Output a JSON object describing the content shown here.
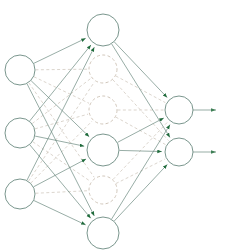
{
  "figure": {
    "type": "neural-network-diagram",
    "title": "",
    "width": 225,
    "height": 251,
    "background": "#ffffff"
  },
  "style": {
    "edge_active_color": "#6b8a80",
    "edge_dropped_color": "#c9bfb3",
    "arrow_color": "#1f6b3b",
    "node_active_stroke": "#6b8a80",
    "node_dropped_stroke": "#cbbfb2",
    "node_fill": "#ffffff",
    "node_radius": 15,
    "edge_width": 0.7,
    "node_stroke_width": 0.9,
    "dropped_dash": "3,2.4"
  },
  "layers": [
    {
      "id": "input",
      "name": "input-layer",
      "x": 20,
      "nodes": [
        {
          "id": "i1",
          "name": "input-node-1",
          "cx": 20,
          "cy": 70,
          "r": 15,
          "state": "active"
        },
        {
          "id": "i2",
          "name": "input-node-2",
          "cx": 20,
          "cy": 133,
          "r": 15,
          "state": "active"
        },
        {
          "id": "i3",
          "name": "input-node-3",
          "cx": 20,
          "cy": 194,
          "r": 15,
          "state": "active"
        }
      ]
    },
    {
      "id": "hidden",
      "name": "hidden-layer",
      "x": 103,
      "nodes": [
        {
          "id": "h1",
          "name": "hidden-node-1",
          "cx": 103,
          "cy": 30,
          "r": 16,
          "state": "active"
        },
        {
          "id": "h2",
          "name": "hidden-node-2",
          "cx": 103,
          "cy": 69,
          "r": 14,
          "state": "dropped"
        },
        {
          "id": "h3",
          "name": "hidden-node-3",
          "cx": 103,
          "cy": 110,
          "r": 14,
          "state": "dropped"
        },
        {
          "id": "h4",
          "name": "hidden-node-4",
          "cx": 103,
          "cy": 150,
          "r": 16,
          "state": "active"
        },
        {
          "id": "h5",
          "name": "hidden-node-5",
          "cx": 103,
          "cy": 190,
          "r": 14,
          "state": "dropped"
        },
        {
          "id": "h6",
          "name": "hidden-node-6",
          "cx": 103,
          "cy": 233,
          "r": 16,
          "state": "active"
        }
      ]
    },
    {
      "id": "output",
      "name": "output-layer",
      "x": 179,
      "nodes": [
        {
          "id": "o1",
          "name": "output-node-1",
          "cx": 179,
          "cy": 110,
          "r": 14,
          "state": "active"
        },
        {
          "id": "o2",
          "name": "output-node-2",
          "cx": 179,
          "cy": 152,
          "r": 14,
          "state": "active"
        }
      ]
    }
  ],
  "edges_input_hidden": [
    {
      "from": "i1",
      "to": "h1",
      "state": "active"
    },
    {
      "from": "i1",
      "to": "h2",
      "state": "dropped"
    },
    {
      "from": "i1",
      "to": "h3",
      "state": "dropped"
    },
    {
      "from": "i1",
      "to": "h4",
      "state": "active"
    },
    {
      "from": "i1",
      "to": "h5",
      "state": "dropped"
    },
    {
      "from": "i1",
      "to": "h6",
      "state": "active"
    },
    {
      "from": "i2",
      "to": "h1",
      "state": "active"
    },
    {
      "from": "i2",
      "to": "h2",
      "state": "dropped"
    },
    {
      "from": "i2",
      "to": "h3",
      "state": "dropped"
    },
    {
      "from": "i2",
      "to": "h4",
      "state": "active"
    },
    {
      "from": "i2",
      "to": "h5",
      "state": "dropped"
    },
    {
      "from": "i2",
      "to": "h6",
      "state": "active"
    },
    {
      "from": "i3",
      "to": "h1",
      "state": "active"
    },
    {
      "from": "i3",
      "to": "h2",
      "state": "dropped"
    },
    {
      "from": "i3",
      "to": "h3",
      "state": "dropped"
    },
    {
      "from": "i3",
      "to": "h4",
      "state": "active"
    },
    {
      "from": "i3",
      "to": "h5",
      "state": "dropped"
    },
    {
      "from": "i3",
      "to": "h6",
      "state": "active"
    }
  ],
  "edges_hidden_output": [
    {
      "from": "h1",
      "to": "o1",
      "state": "active"
    },
    {
      "from": "h1",
      "to": "o2",
      "state": "active"
    },
    {
      "from": "h2",
      "to": "o1",
      "state": "dropped"
    },
    {
      "from": "h2",
      "to": "o2",
      "state": "dropped"
    },
    {
      "from": "h3",
      "to": "o1",
      "state": "dropped"
    },
    {
      "from": "h3",
      "to": "o2",
      "state": "dropped"
    },
    {
      "from": "h4",
      "to": "o1",
      "state": "active"
    },
    {
      "from": "h4",
      "to": "o2",
      "state": "active"
    },
    {
      "from": "h5",
      "to": "o1",
      "state": "dropped"
    },
    {
      "from": "h5",
      "to": "o2",
      "state": "dropped"
    },
    {
      "from": "h6",
      "to": "o1",
      "state": "active"
    },
    {
      "from": "h6",
      "to": "o2",
      "state": "active"
    }
  ],
  "output_arrows": [
    {
      "id": "out1",
      "name": "output-arrow-1",
      "x1": 193,
      "y1": 110,
      "x2": 216,
      "y2": 110,
      "state": "active"
    },
    {
      "id": "out2",
      "name": "output-arrow-2",
      "x1": 193,
      "y1": 152,
      "x2": 216,
      "y2": 152,
      "state": "active"
    }
  ]
}
